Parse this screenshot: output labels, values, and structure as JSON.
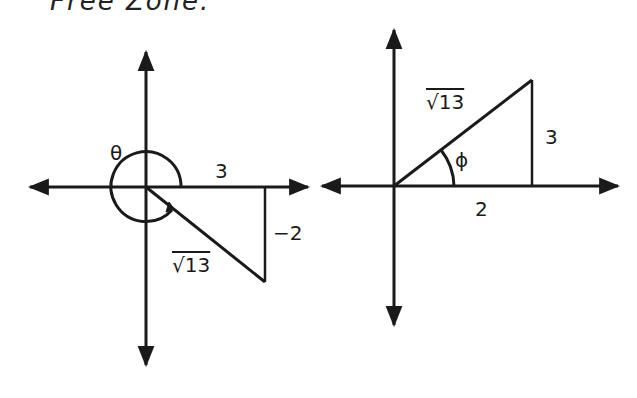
{
  "header": {
    "cropped_text": "Free Zone."
  },
  "left_diagram": {
    "angle_label": "θ",
    "x_label": "3",
    "y_label": "−2",
    "hyp_label": "√13"
  },
  "right_diagram": {
    "angle_label": "ϕ",
    "x_label": "2",
    "y_label": "3",
    "hyp_label": "√13"
  }
}
